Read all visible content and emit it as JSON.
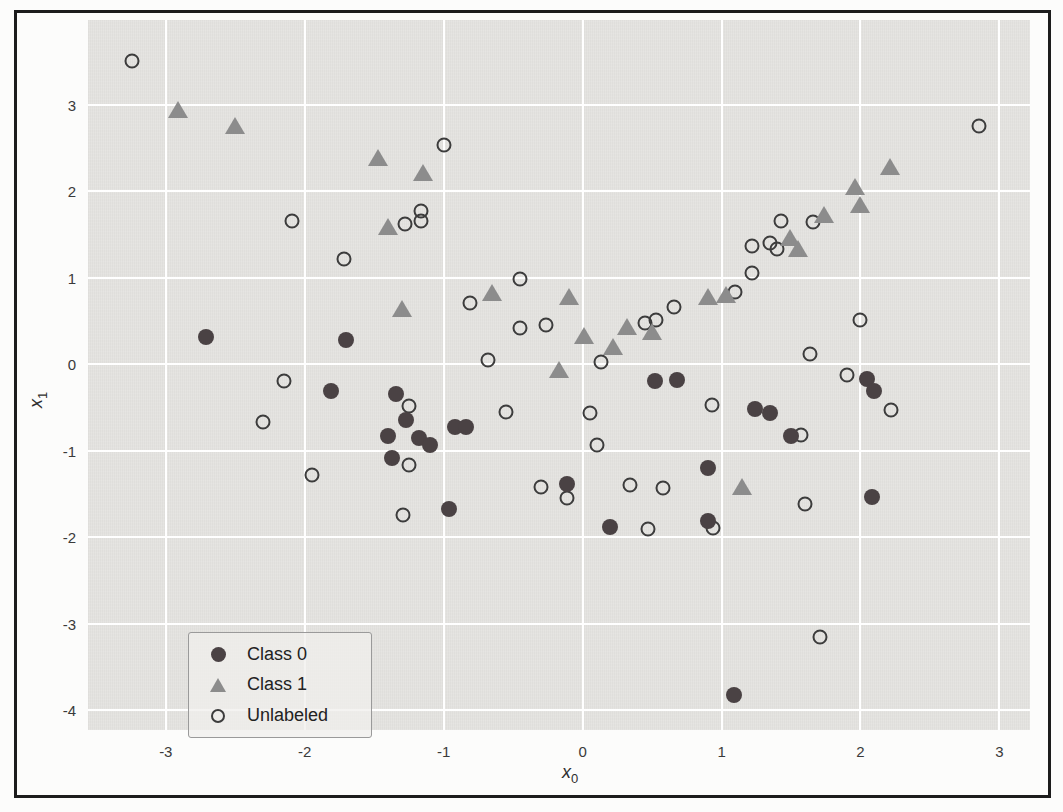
{
  "axes": {
    "xlabel": {
      "base": "x",
      "sub": "0"
    },
    "ylabel": {
      "base": "x",
      "sub": "1"
    }
  },
  "legend": {
    "items": [
      {
        "label": "Class 0",
        "marker": "filled-circle"
      },
      {
        "label": "Class 1",
        "marker": "triangle"
      },
      {
        "label": "Unlabeled",
        "marker": "open-circle"
      }
    ]
  },
  "colors": {
    "class0": "#4a4244",
    "class1": "#8c8c8c",
    "unlabeled_stroke": "#3c3c3c",
    "plot_background": "#e4e3e0",
    "grid": "#ffffff",
    "frame": "#1c1c1c",
    "tick_text": "#3a3a3a"
  },
  "chart_data": {
    "type": "scatter",
    "title": "",
    "xlabel": "x0",
    "ylabel": "x1",
    "xlim": [
      -3.56,
      3.22
    ],
    "ylim": [
      -4.23,
      3.98
    ],
    "x_ticks": [
      -3,
      -2,
      -1,
      0,
      1,
      2,
      3
    ],
    "y_ticks": [
      3,
      2,
      1,
      0,
      -1,
      -2,
      -3,
      -4
    ],
    "grid": true,
    "legend_position": "lower-left",
    "series": [
      {
        "name": "Unlabeled",
        "marker": "open-circle",
        "color": "#3c3c3c",
        "points": [
          [
            -3.24,
            3.51
          ],
          [
            -1.0,
            2.53
          ],
          [
            -2.09,
            1.65
          ],
          [
            -1.72,
            1.22
          ],
          [
            -1.28,
            1.62
          ],
          [
            -1.16,
            1.77
          ],
          [
            -1.16,
            1.65
          ],
          [
            -0.45,
            0.99
          ],
          [
            -0.81,
            0.71
          ],
          [
            -0.45,
            0.42
          ],
          [
            -0.26,
            0.45
          ],
          [
            -0.68,
            0.05
          ],
          [
            0.13,
            0.02
          ],
          [
            0.45,
            0.48
          ],
          [
            0.53,
            0.51
          ],
          [
            0.66,
            0.66
          ],
          [
            1.1,
            0.84
          ],
          [
            1.22,
            1.37
          ],
          [
            1.22,
            1.06
          ],
          [
            1.35,
            1.4
          ],
          [
            1.4,
            1.33
          ],
          [
            1.43,
            1.65
          ],
          [
            1.66,
            1.64
          ],
          [
            2.0,
            0.51
          ],
          [
            1.64,
            0.12
          ],
          [
            1.9,
            -0.13
          ],
          [
            2.22,
            -0.53
          ],
          [
            2.85,
            2.75
          ],
          [
            0.93,
            -0.47
          ],
          [
            1.57,
            -0.82
          ],
          [
            -2.15,
            -0.19
          ],
          [
            -2.3,
            -0.67
          ],
          [
            -1.25,
            -0.48
          ],
          [
            -1.25,
            -1.16
          ],
          [
            -1.95,
            -1.28
          ],
          [
            -0.55,
            -0.55
          ],
          [
            0.05,
            -0.57
          ],
          [
            0.1,
            -0.93
          ],
          [
            -0.3,
            -1.42
          ],
          [
            -0.11,
            -1.55
          ],
          [
            0.34,
            -1.4
          ],
          [
            0.58,
            -1.43
          ],
          [
            0.47,
            -1.9
          ],
          [
            0.94,
            -1.89
          ],
          [
            -1.29,
            -1.74
          ],
          [
            1.6,
            -1.62
          ],
          [
            1.71,
            -3.16
          ]
        ]
      },
      {
        "name": "Class 1",
        "marker": "triangle",
        "color": "#8c8c8c",
        "points": [
          [
            -2.91,
            2.94
          ],
          [
            -2.5,
            2.75
          ],
          [
            -1.47,
            2.38
          ],
          [
            -1.15,
            2.21
          ],
          [
            -1.4,
            1.59
          ],
          [
            -1.3,
            0.64
          ],
          [
            -0.65,
            0.82
          ],
          [
            -0.1,
            0.78
          ],
          [
            -0.17,
            -0.07
          ],
          [
            0.01,
            0.33
          ],
          [
            0.22,
            0.2
          ],
          [
            0.32,
            0.43
          ],
          [
            0.5,
            0.37
          ],
          [
            0.9,
            0.78
          ],
          [
            1.03,
            0.8
          ],
          [
            1.49,
            1.46
          ],
          [
            1.55,
            1.33
          ],
          [
            1.74,
            1.72
          ],
          [
            1.96,
            2.05
          ],
          [
            2.0,
            1.84
          ],
          [
            2.21,
            2.28
          ],
          [
            1.15,
            -1.42
          ]
        ]
      },
      {
        "name": "Class 0",
        "marker": "filled-circle",
        "color": "#4a4244",
        "points": [
          [
            -2.71,
            0.31
          ],
          [
            -1.7,
            0.28
          ],
          [
            -1.81,
            -0.31
          ],
          [
            -1.34,
            -0.35
          ],
          [
            -1.27,
            -0.65
          ],
          [
            -1.4,
            -0.83
          ],
          [
            -1.18,
            -0.85
          ],
          [
            -1.1,
            -0.94
          ],
          [
            -1.37,
            -1.09
          ],
          [
            -0.92,
            -0.73
          ],
          [
            -0.84,
            -0.73
          ],
          [
            -0.96,
            -1.67
          ],
          [
            -0.11,
            -1.39
          ],
          [
            0.2,
            -1.88
          ],
          [
            0.52,
            -0.2
          ],
          [
            0.68,
            -0.18
          ],
          [
            0.9,
            -1.2
          ],
          [
            0.9,
            -1.81
          ],
          [
            1.24,
            -0.52
          ],
          [
            1.35,
            -0.57
          ],
          [
            1.5,
            -0.83
          ],
          [
            2.05,
            -0.17
          ],
          [
            2.1,
            -0.31
          ],
          [
            2.08,
            -1.54
          ],
          [
            1.09,
            -3.83
          ]
        ]
      }
    ]
  }
}
